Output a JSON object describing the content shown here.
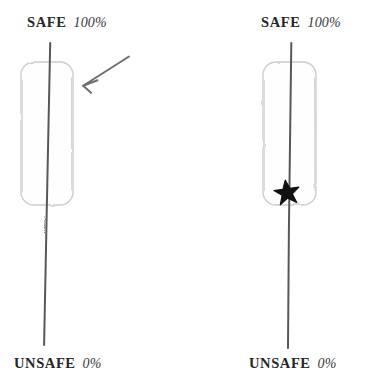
{
  "figure": {
    "width": 374,
    "height": 389,
    "background": "#ffffff",
    "style": "hand-drawn sketch diagram",
    "panels": [
      {
        "id": "left",
        "name": "panel-without-marker",
        "top_label": {
          "word": "SAFE",
          "value": "100%"
        },
        "bottom_label": {
          "word": "UNSAFE",
          "value": "0%"
        },
        "has_star_marker": false,
        "has_arrow_annotation": true
      },
      {
        "id": "right",
        "name": "panel-with-marker",
        "top_label": {
          "word": "SAFE",
          "value": "100%"
        },
        "bottom_label": {
          "word": "UNSAFE",
          "value": "0%"
        },
        "has_star_marker": true,
        "has_arrow_annotation": false
      }
    ]
  },
  "labels": {
    "safe_word": "SAFE",
    "safe_value": "100%",
    "unsafe_word": "UNSAFE",
    "unsafe_value": "0%"
  },
  "colors": {
    "trajectory_line": "#595959",
    "box_outline": "#cfcfcf",
    "box_fill": "#fefefe",
    "arrow": "#6e6e6e",
    "star": "#111111",
    "text": "#262626",
    "background": "#ffffff"
  },
  "geometry": {
    "left_box": {
      "x": 21,
      "y": 62,
      "width": 52,
      "height": 143,
      "radius": 13
    },
    "right_box": {
      "x": 263,
      "y": 62,
      "width": 53,
      "height": 143,
      "radius": 13
    },
    "left_line": {
      "x1": 50,
      "y1": 43,
      "x2": 44,
      "y2": 345
    },
    "right_line": {
      "x1": 291,
      "y1": 43,
      "x2": 288,
      "y2": 348
    },
    "arrow": {
      "tail_x": 129,
      "tail_y": 57,
      "head_x": 82,
      "head_y": 86
    },
    "star": {
      "cx": 287,
      "cy": 193,
      "radius": 12
    }
  }
}
